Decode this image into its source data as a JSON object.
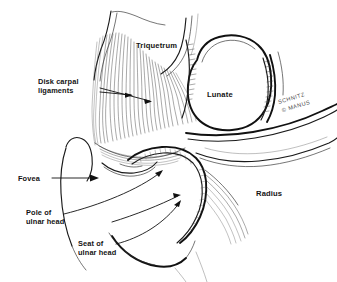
{
  "figure": {
    "background_color": "#ffffff",
    "ink_color": "#111111",
    "width": 337,
    "height": 282
  },
  "bone_labels": [
    {
      "id": "triquetrum",
      "text": "Triquetrum",
      "x": 136,
      "y": 48
    },
    {
      "id": "lunate",
      "text": "Lunate",
      "x": 207,
      "y": 97
    },
    {
      "id": "radius",
      "text": "Radius",
      "x": 256,
      "y": 196
    }
  ],
  "callouts": [
    {
      "id": "disk-carpal-ligaments",
      "line1": "Disk carpal",
      "line2": "ligaments",
      "x": 38,
      "y": 84
    },
    {
      "id": "fovea",
      "line1": "Fovea",
      "line2": "",
      "x": 18,
      "y": 180
    },
    {
      "id": "pole-of-ulnar-head",
      "line1": "Pole of",
      "line2": "ulnar head",
      "x": 26,
      "y": 215
    },
    {
      "id": "seat-of-ulnar-head",
      "line1": "Seat of",
      "line2": "ulnar head",
      "x": 78,
      "y": 246
    }
  ],
  "signature": {
    "artist": "SCHNITZ",
    "mark": "© MANUS",
    "x": 292,
    "y": 100
  }
}
